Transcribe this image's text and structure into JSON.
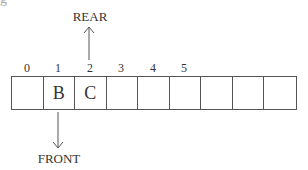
{
  "diagram": {
    "title_partial": "g",
    "pointers": {
      "rear": {
        "label": "REAR",
        "index": 2,
        "direction": "up"
      },
      "front": {
        "label": "FRONT",
        "index": 1,
        "direction": "down"
      }
    },
    "indices": [
      "0",
      "1",
      "2",
      "3",
      "4",
      "5"
    ],
    "cells": [
      "",
      "B",
      "C",
      "",
      "",
      "",
      "",
      "",
      ""
    ],
    "colors": {
      "stroke": "#555555",
      "text": "#333333",
      "background": "#ffffff"
    }
  }
}
